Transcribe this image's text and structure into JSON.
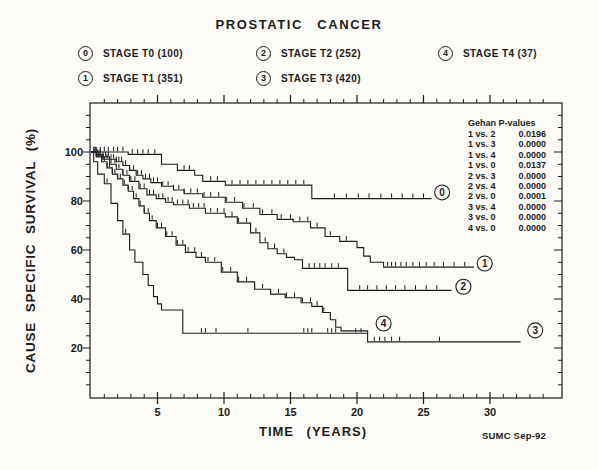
{
  "title": "PROSTATIC CANCER",
  "legend": {
    "items": [
      {
        "num": "0",
        "label": "STAGE T0  (100)"
      },
      {
        "num": "1",
        "label": "STAGE T1  (351)"
      },
      {
        "num": "2",
        "label": "STAGE T2  (252)"
      },
      {
        "num": "3",
        "label": "STAGE T3  (420)"
      },
      {
        "num": "4",
        "label": "STAGE T4  (37)"
      }
    ]
  },
  "gehan": {
    "header": "Gehan P-values",
    "rows": [
      {
        "pair": "1 vs. 2",
        "p": "0.0196"
      },
      {
        "pair": "1 vs. 3",
        "p": "0.0000"
      },
      {
        "pair": "1 vs. 4",
        "p": "0.0000"
      },
      {
        "pair": "1 vs. 0",
        "p": "0.0137"
      },
      {
        "pair": "2 vs. 3",
        "p": "0.0000"
      },
      {
        "pair": "2 vs. 4",
        "p": "0.0000"
      },
      {
        "pair": "2 vs. 0",
        "p": "0.0001"
      },
      {
        "pair": "3 vs. 4",
        "p": "0.0000"
      },
      {
        "pair": "3 vs. 0",
        "p": "0.0000"
      },
      {
        "pair": "4 vs. 0",
        "p": "0.0000"
      }
    ]
  },
  "axes": {
    "x": {
      "label": "TIME  (YEARS)",
      "major_ticks": [
        5,
        10,
        15,
        20,
        25,
        30
      ],
      "minor_step": 1,
      "minor_max": 34,
      "range": [
        0,
        35.4
      ]
    },
    "y": {
      "label": "CAUSE  SPECIFIC  SURVIVAL  (%)",
      "major_ticks": [
        20,
        40,
        60,
        80,
        100
      ],
      "minor_step": 5,
      "minor_max": 115,
      "range": [
        0,
        120
      ]
    }
  },
  "footer": {
    "credit": "SUMC Sep-92"
  },
  "colors": {
    "ink": "#1c1c1c",
    "paper": "#fcfbf8"
  },
  "chart_data": {
    "type": "line",
    "subtype": "kaplan-meier-step",
    "title": "PROSTATIC CANCER",
    "xlabel": "TIME (YEARS)",
    "ylabel": "CAUSE SPECIFIC SURVIVAL (%)",
    "xlim": [
      0,
      35.4
    ],
    "ylim": [
      0,
      120
    ],
    "grid": false,
    "legend_position": "top",
    "series": [
      {
        "id": "0",
        "name": "STAGE T0",
        "n": 100,
        "points": [
          [
            0,
            100
          ],
          [
            2.8,
            99
          ],
          [
            5.3,
            95
          ],
          [
            6.5,
            92.5
          ],
          [
            7.8,
            90.5
          ],
          [
            8.4,
            88
          ],
          [
            10.1,
            86.5
          ],
          [
            16.6,
            81
          ],
          [
            25.6,
            81
          ]
        ],
        "censor_ticks": [
          0.4,
          0.7,
          1.0,
          1.3,
          1.7,
          2.0,
          2.4,
          3.1,
          3.5,
          3.9,
          4.3,
          4.8,
          7.0,
          7.4,
          9.0,
          9.5,
          10.6,
          11.2,
          11.8,
          12.4,
          13.0,
          13.6,
          14.2,
          14.8,
          15.4,
          16.0,
          18.3,
          19.2,
          20.1,
          20.9,
          21.8,
          22.6,
          23.4,
          24.2,
          25.0
        ],
        "label_at": [
          26.4,
          83.5
        ]
      },
      {
        "id": "1",
        "name": "STAGE T1",
        "n": 351,
        "points": [
          [
            0,
            100
          ],
          [
            0.4,
            99
          ],
          [
            0.9,
            98
          ],
          [
            1.4,
            97
          ],
          [
            1.9,
            96
          ],
          [
            2.4,
            94.5
          ],
          [
            2.9,
            92.5
          ],
          [
            3.4,
            90.5
          ],
          [
            3.9,
            89
          ],
          [
            4.5,
            87.5
          ],
          [
            5.3,
            86
          ],
          [
            6.2,
            84.5
          ],
          [
            7.0,
            83
          ],
          [
            8.4,
            81.5
          ],
          [
            10.1,
            79.5
          ],
          [
            11.4,
            77
          ],
          [
            12.7,
            74.5
          ],
          [
            14.0,
            72.5
          ],
          [
            15.2,
            71.5
          ],
          [
            16.5,
            69
          ],
          [
            17.6,
            65.5
          ],
          [
            18.7,
            63.5
          ],
          [
            20.0,
            61
          ],
          [
            20.5,
            57.5
          ],
          [
            21.0,
            55
          ],
          [
            22.0,
            53
          ],
          [
            28.8,
            53
          ]
        ],
        "censor_ticks": [
          0.3,
          0.5,
          0.7,
          0.9,
          1.1,
          1.3,
          1.5,
          1.7,
          1.9,
          2.1,
          2.3,
          2.6,
          2.9,
          3.2,
          3.5,
          3.8,
          4.1,
          4.4,
          4.7,
          5.0,
          5.4,
          5.8,
          6.2,
          6.6,
          7.0,
          7.5,
          8.0,
          8.5,
          9.0,
          9.6,
          10.2,
          10.8,
          11.5,
          12.2,
          12.9,
          13.6,
          14.3,
          15.0,
          15.7,
          16.3,
          17.0,
          18.0,
          19.2,
          22.3,
          22.6,
          22.9,
          23.3,
          23.7,
          24.2,
          24.7,
          25.2,
          25.8,
          26.5,
          27.3,
          28.1
        ],
        "label_at": [
          29.6,
          54.5
        ]
      },
      {
        "id": "2",
        "name": "STAGE T2",
        "n": 252,
        "points": [
          [
            0,
            100
          ],
          [
            0.4,
            98.5
          ],
          [
            0.9,
            97
          ],
          [
            1.4,
            95
          ],
          [
            1.9,
            93
          ],
          [
            2.4,
            90.5
          ],
          [
            2.9,
            88
          ],
          [
            3.6,
            85
          ],
          [
            4.2,
            82.5
          ],
          [
            4.9,
            81
          ],
          [
            5.6,
            79.5
          ],
          [
            6.2,
            78.5
          ],
          [
            7.4,
            77
          ],
          [
            8.6,
            75
          ],
          [
            10.1,
            73.5
          ],
          [
            11.0,
            71
          ],
          [
            12.0,
            67
          ],
          [
            12.7,
            63
          ],
          [
            13.3,
            60.5
          ],
          [
            14.0,
            58.5
          ],
          [
            14.7,
            57
          ],
          [
            15.3,
            56
          ],
          [
            15.9,
            52.5
          ],
          [
            19.3,
            43.5
          ],
          [
            27.1,
            43.5
          ]
        ],
        "censor_ticks": [
          0.3,
          0.6,
          0.9,
          1.2,
          1.5,
          1.8,
          2.1,
          2.4,
          2.7,
          3.0,
          3.3,
          3.7,
          4.0,
          4.4,
          4.7,
          5.1,
          5.4,
          5.8,
          6.1,
          6.5,
          6.9,
          7.3,
          7.7,
          8.1,
          8.5,
          9.0,
          9.5,
          10.0,
          10.6,
          11.1,
          11.7,
          12.4,
          13.1,
          13.8,
          14.5,
          16.4,
          16.8,
          17.2,
          17.6,
          18.1,
          18.6,
          20.2,
          20.8,
          21.5,
          22.2,
          22.9,
          23.6,
          24.4,
          25.2,
          26.0
        ],
        "label_at": [
          28.0,
          45.0
        ]
      },
      {
        "id": "3",
        "name": "STAGE T3",
        "n": 420,
        "points": [
          [
            0,
            100
          ],
          [
            0.4,
            98
          ],
          [
            0.8,
            96
          ],
          [
            1.2,
            93.5
          ],
          [
            1.6,
            91
          ],
          [
            2.0,
            89
          ],
          [
            2.4,
            86.5
          ],
          [
            2.8,
            84
          ],
          [
            3.2,
            81
          ],
          [
            3.6,
            78
          ],
          [
            4.0,
            75
          ],
          [
            4.4,
            72
          ],
          [
            4.9,
            69
          ],
          [
            5.6,
            65.5
          ],
          [
            6.4,
            62
          ],
          [
            7.1,
            59
          ],
          [
            7.9,
            57
          ],
          [
            8.6,
            55
          ],
          [
            9.8,
            51
          ],
          [
            11.0,
            47
          ],
          [
            12.3,
            44
          ],
          [
            13.5,
            42
          ],
          [
            14.6,
            40.5
          ],
          [
            15.8,
            38.5
          ],
          [
            16.6,
            37
          ],
          [
            17.4,
            34.5
          ],
          [
            18.0,
            31.5
          ],
          [
            18.4,
            28.5
          ],
          [
            18.8,
            27
          ],
          [
            20.8,
            22.5
          ],
          [
            32.3,
            22.5
          ]
        ],
        "censor_ticks": [
          0.2,
          0.4,
          0.6,
          0.8,
          1.0,
          1.2,
          1.4,
          1.6,
          1.8,
          2.0,
          2.2,
          2.5,
          2.8,
          3.1,
          3.4,
          3.7,
          4.0,
          4.3,
          4.6,
          5.0,
          5.3,
          5.7,
          6.1,
          6.5,
          6.9,
          7.3,
          7.8,
          8.3,
          8.8,
          9.3,
          9.9,
          10.5,
          11.1,
          11.7,
          12.3,
          12.9,
          13.5,
          14.1,
          14.7,
          15.3,
          15.9,
          16.5,
          17.0,
          17.5,
          21.3,
          21.7,
          22.1,
          22.6,
          23.2,
          26.2
        ],
        "label_at": [
          33.4,
          27.2
        ]
      },
      {
        "id": "4",
        "name": "STAGE T4",
        "n": 37,
        "points": [
          [
            0,
            100
          ],
          [
            0.2,
            96
          ],
          [
            0.5,
            91
          ],
          [
            1.0,
            87
          ],
          [
            1.5,
            79
          ],
          [
            2.0,
            72
          ],
          [
            2.4,
            66.5
          ],
          [
            2.9,
            60
          ],
          [
            3.3,
            55
          ],
          [
            3.9,
            50
          ],
          [
            4.3,
            45.5
          ],
          [
            4.7,
            41
          ],
          [
            5.0,
            38
          ],
          [
            5.3,
            35.5
          ],
          [
            6.9,
            26
          ],
          [
            20.8,
            26
          ]
        ],
        "censor_ticks": [
          1.2,
          2.6,
          8.3,
          8.6,
          9.4,
          11.8,
          16.0,
          16.3,
          16.6,
          17.8,
          18.1,
          18.4,
          19.9,
          20.3
        ],
        "label_at": [
          22.0,
          30.0
        ]
      }
    ]
  }
}
